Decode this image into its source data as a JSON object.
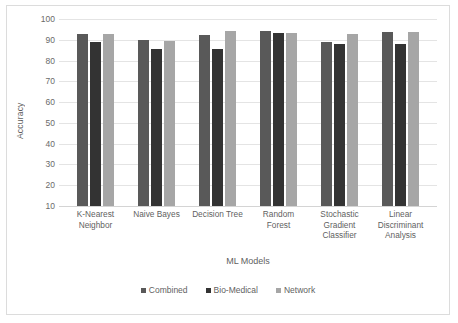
{
  "chart_data": {
    "type": "bar",
    "title": "",
    "xlabel": "ML Models",
    "ylabel": "Accuracy",
    "ylim": [
      10,
      100
    ],
    "yticks": [
      100,
      90,
      80,
      70,
      60,
      50,
      40,
      30,
      20,
      10
    ],
    "grid": true,
    "legend_position": "bottom",
    "categories": [
      "K-Nearest Neighbor",
      "Naive Bayes",
      "Decision Tree",
      "Random Forest",
      "Stochastic Gradient Classifier",
      "Linear Discriminant Analysis"
    ],
    "category_lines": [
      [
        "K-Nearest",
        "Neighbor"
      ],
      [
        "Naive Bayes"
      ],
      [
        "Decision Tree"
      ],
      [
        "Random",
        "Forest"
      ],
      [
        "Stochastic",
        "Gradient",
        "Classifier"
      ],
      [
        "Linear",
        "Discriminant",
        "Analysis"
      ]
    ],
    "series": [
      {
        "name": "Combined",
        "color": "#595959",
        "values": [
          92.6,
          89.7,
          92.5,
          94.2,
          89.1,
          93.6
        ]
      },
      {
        "name": "Bio-Medical",
        "color": "#333333",
        "values": [
          88.7,
          85.6,
          85.7,
          93.4,
          87.8,
          87.9
        ]
      },
      {
        "name": "Network",
        "color": "#a6a6a6",
        "values": [
          92.6,
          89.6,
          94.1,
          93.2,
          92.6,
          93.6
        ]
      }
    ]
  },
  "colors": {
    "combined": "#595959",
    "bio_medical": "#333333",
    "network": "#a6a6a6",
    "gridline": "#e4e4e4",
    "frame": "#dcdcdc",
    "text": "#5f5f5f"
  }
}
